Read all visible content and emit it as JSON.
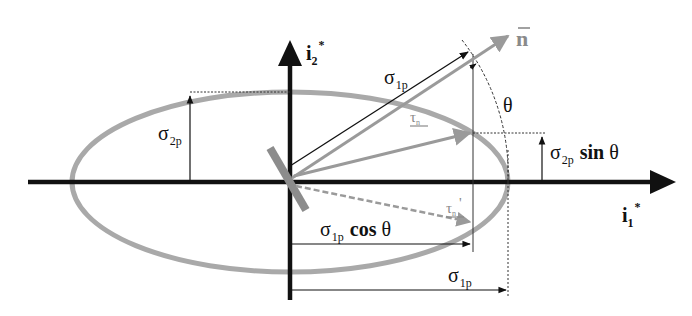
{
  "diagram": {
    "type": "stress-ellipse (Mohr/Lamé ellipse of principal stresses)",
    "colors": {
      "axis": "#111111",
      "ellipse": "#a9a9a9",
      "vector_gray": "#9a9a9a",
      "vector_black": "#111111",
      "plane_bar": "#8c8c8c"
    },
    "axes": {
      "horizontal": {
        "label_main": "i",
        "label_sub": "1",
        "label_sup": "*"
      },
      "vertical": {
        "label_main": "i",
        "label_sub": "2",
        "label_sup": "*"
      }
    },
    "labels": {
      "normal_vector": "n",
      "normal_bar": "‾",
      "sigma_1p_vector": {
        "sym": "σ",
        "sub": "1p"
      },
      "sigma_2p_height": {
        "sym": "σ",
        "sub": "2p"
      },
      "theta_angle": "θ",
      "tau_n": {
        "sym": "τ",
        "sub": "n"
      },
      "tau_n_prime": {
        "sym": "τ",
        "sub": "n",
        "prime": "'"
      },
      "sigma_2p_sin": {
        "sym": "σ",
        "sub": "2p",
        "func": "sin",
        "arg": "θ"
      },
      "sigma_1p_cos": {
        "sym": "σ",
        "sub": "1p",
        "func": "cos",
        "arg": "θ"
      },
      "sigma_1p_bottom": {
        "sym": "σ",
        "sub": "1p"
      }
    }
  }
}
